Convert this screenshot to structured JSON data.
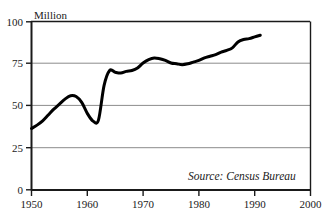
{
  "chart_data": {
    "type": "line",
    "title": "",
    "subtitle": "",
    "xlabel": "",
    "ylabel": "Million",
    "ylabel_position": "top-left-above-axis",
    "xlim": [
      1950,
      2000
    ],
    "ylim": [
      0,
      100
    ],
    "xticks": [
      1950,
      1960,
      1970,
      1980,
      1990,
      2000
    ],
    "xtick_labels": [
      "1950",
      "1960",
      "1970",
      "1980",
      "1990",
      "2000"
    ],
    "yticks": [
      0,
      25,
      50,
      75,
      100
    ],
    "ytick_labels": [
      "0",
      "25",
      "50",
      "75",
      "100"
    ],
    "grid": "horizontal",
    "grid_color": "#808080",
    "legend": "none",
    "line_color": "#000000",
    "line_width": 3,
    "annotations": [
      {
        "name": "source-note",
        "text": "Source: Census Bureau",
        "x": 1978.5,
        "y": 13,
        "style": "italic"
      }
    ],
    "series": [
      {
        "name": "value",
        "x": [
          1950,
          1951,
          1952,
          1953,
          1954,
          1955,
          1956,
          1957,
          1958,
          1959,
          1960,
          1961,
          1962,
          1963,
          1964,
          1965,
          1966,
          1967,
          1968,
          1969,
          1970,
          1971,
          1972,
          1973,
          1974,
          1975,
          1976,
          1977,
          1978,
          1979,
          1980,
          1981,
          1982,
          1983,
          1984,
          1985,
          1986,
          1987,
          1988,
          1989,
          1990,
          1991
        ],
        "values": [
          36.5,
          38.5,
          41.0,
          44.5,
          48.0,
          51.0,
          54.0,
          56.0,
          55.5,
          52.0,
          45.5,
          41.0,
          41.5,
          62.0,
          71.0,
          70.0,
          69.5,
          70.5,
          71.0,
          72.5,
          75.5,
          77.5,
          78.5,
          78.0,
          77.0,
          75.5,
          75.0,
          74.5,
          75.0,
          76.0,
          77.0,
          78.5,
          79.5,
          80.5,
          82.0,
          83.0,
          84.5,
          88.0,
          89.5,
          90.0,
          91.0,
          92.0
        ]
      }
    ]
  },
  "axes": {
    "ylabel": "Million",
    "source": "Source: Census Bureau"
  }
}
